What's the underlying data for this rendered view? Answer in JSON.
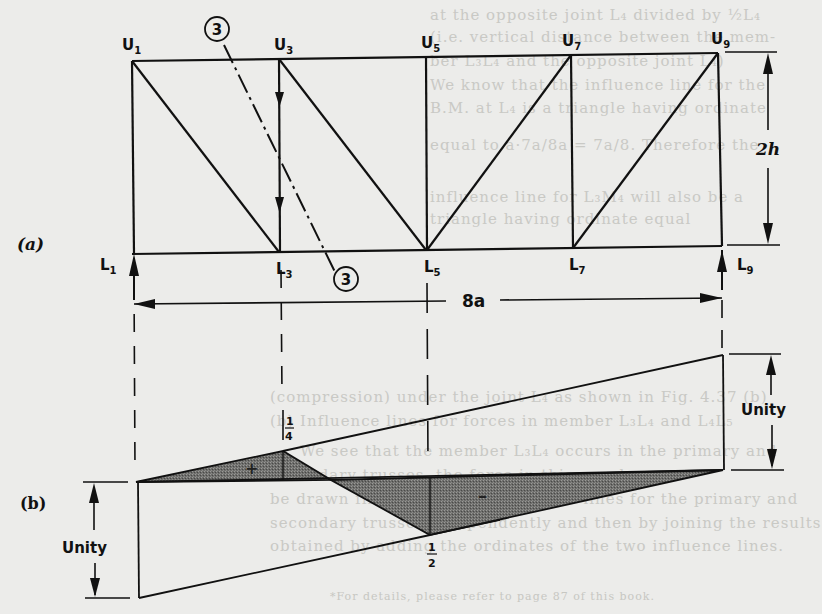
{
  "figure": {
    "panel_a_label": "(a)",
    "panel_b_label": "(b)",
    "truss": {
      "upper_joints": [
        {
          "name": "U",
          "sub": "1"
        },
        {
          "name": "U",
          "sub": "3"
        },
        {
          "name": "U",
          "sub": "5"
        },
        {
          "name": "U",
          "sub": "7"
        },
        {
          "name": "U",
          "sub": "9"
        }
      ],
      "lower_joints": [
        {
          "name": "L",
          "sub": "1"
        },
        {
          "name": "L",
          "sub": "3"
        },
        {
          "name": "L",
          "sub": "5"
        },
        {
          "name": "L",
          "sub": "7"
        },
        {
          "name": "L",
          "sub": "9"
        }
      ],
      "section_marker_top": "3",
      "section_marker_bottom": "3",
      "span_label": "8a",
      "height_label": "2h"
    },
    "influence_line": {
      "ordinate_quarter": "1",
      "ordinate_quarter_den": "4",
      "ordinate_half": "1",
      "ordinate_half_den": "2",
      "positive_sign": "+",
      "negative_sign": "–",
      "unity_left": "Unity",
      "unity_right": "Unity"
    }
  },
  "background_bleed_text": {
    "lines": [
      "at the opposite joint L₄ divided by ½L₄",
      "(i.e. vertical distance between the mem-",
      "ber L₃L₄ and the opposite joint L₄)",
      "We know that the influence line for the",
      "B.M. at L₄ is a triangle having ordinate",
      "equal to  a·7a/8a = 7a/8.  Therefore the",
      "influence line for L₃M₄ will also be a",
      "triangle having ordinate equal",
      "(compression) under the joint L₄ as shown in Fig. 4.37 (b)",
      "(b) Influence lines for forces in member L₃L₄ and L₄L₅",
      "We see that the member L₃L₄ occurs in the primary and",
      "secondary trusses, the force in this member can",
      "be drawn first by drawing influence lines for the primary and",
      "secondary trusses independently and then by joining the results",
      "obtained by adding the ordinates of the two influence lines."
    ],
    "footnote": "*For details, please refer to page 87 of this book."
  }
}
